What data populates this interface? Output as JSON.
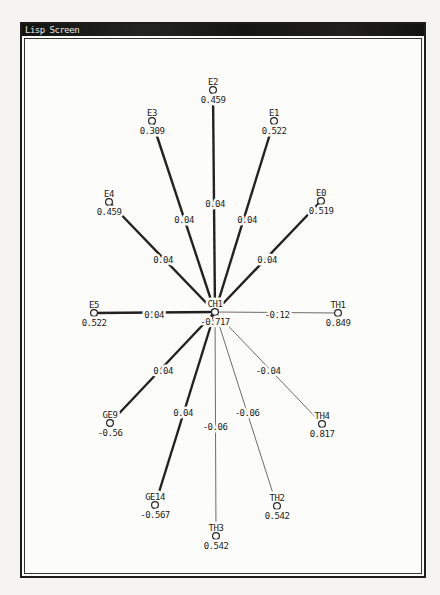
{
  "window": {
    "title": "Lisp Screen"
  },
  "colors": {
    "ink": "#232220",
    "thin_edge": "#6e6c68",
    "paper": "#fcfcfa",
    "titlebar": "#171716"
  },
  "chart_data": {
    "type": "network-graph",
    "title": "Lisp Screen",
    "center": "CH1",
    "nodes": [
      {
        "id": "CH1",
        "label": "CH1",
        "value": "-0.717",
        "x": 215,
        "y": 312
      },
      {
        "id": "E2",
        "label": "E2",
        "value": "0.459",
        "x": 213,
        "y": 90
      },
      {
        "id": "E3",
        "label": "E3",
        "value": "0.309",
        "x": 152,
        "y": 121
      },
      {
        "id": "E1",
        "label": "E1",
        "value": "0.522",
        "x": 274,
        "y": 121
      },
      {
        "id": "E4",
        "label": "E4",
        "value": "0.459",
        "x": 109,
        "y": 202
      },
      {
        "id": "E0",
        "label": "E0",
        "value": "0.519",
        "x": 321,
        "y": 201
      },
      {
        "id": "E5",
        "label": "E5",
        "value": "0.522",
        "x": 94,
        "y": 313
      },
      {
        "id": "TH1",
        "label": "TH1",
        "value": "0.849",
        "x": 338,
        "y": 313
      },
      {
        "id": "GE9",
        "label": "GE9",
        "value": "-0.56",
        "x": 110,
        "y": 423
      },
      {
        "id": "TH4",
        "label": "TH4",
        "value": "0.817",
        "x": 322,
        "y": 424
      },
      {
        "id": "GE14",
        "label": "GE14",
        "value": "-0.567",
        "x": 155,
        "y": 505
      },
      {
        "id": "TH2",
        "label": "TH2",
        "value": "0.542",
        "x": 277,
        "y": 506
      },
      {
        "id": "TH3",
        "label": "TH3",
        "value": "0.542",
        "x": 216,
        "y": 536
      }
    ],
    "edges": [
      {
        "from": "CH1",
        "to": "E2",
        "weight": "0.04",
        "thick": true,
        "label_x": 215,
        "label_y": 204
      },
      {
        "from": "CH1",
        "to": "E3",
        "weight": "0.04",
        "thick": true,
        "label_x": 184,
        "label_y": 220
      },
      {
        "from": "CH1",
        "to": "E1",
        "weight": "0.04",
        "thick": true,
        "label_x": 247,
        "label_y": 220
      },
      {
        "from": "CH1",
        "to": "E4",
        "weight": "0.04",
        "thick": true,
        "label_x": 163,
        "label_y": 260
      },
      {
        "from": "CH1",
        "to": "E0",
        "weight": "0.04",
        "thick": true,
        "label_x": 267,
        "label_y": 260
      },
      {
        "from": "CH1",
        "to": "E5",
        "weight": "0.04",
        "thick": true,
        "label_x": 154,
        "label_y": 315
      },
      {
        "from": "CH1",
        "to": "TH1",
        "weight": "-0.12",
        "thick": false,
        "label_x": 277,
        "label_y": 315
      },
      {
        "from": "CH1",
        "to": "GE9",
        "weight": "0.04",
        "thick": true,
        "label_x": 163,
        "label_y": 371
      },
      {
        "from": "CH1",
        "to": "TH4",
        "weight": "-0.04",
        "thick": false,
        "label_x": 268,
        "label_y": 371
      },
      {
        "from": "CH1",
        "to": "GE14",
        "weight": "0.04",
        "thick": true,
        "label_x": 183,
        "label_y": 413
      },
      {
        "from": "CH1",
        "to": "TH2",
        "weight": "-0.06",
        "thick": false,
        "label_x": 247,
        "label_y": 413
      },
      {
        "from": "CH1",
        "to": "TH3",
        "weight": "-0.06",
        "thick": false,
        "label_x": 215,
        "label_y": 427
      }
    ]
  }
}
